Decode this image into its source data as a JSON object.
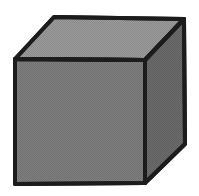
{
  "figure": {
    "colors": {
      "background": "#ffffff",
      "top_face": "#9c9c9c",
      "front_face": "#808080",
      "side_face": "#6c6c6c",
      "outline": "#1c1c1c"
    },
    "vertices": {
      "front_top_left": [
        15,
        59
      ],
      "front_top_right": [
        145,
        60
      ],
      "front_bottom_right": [
        145,
        183
      ],
      "front_bottom_left": [
        15,
        184
      ],
      "back_top_left": [
        54,
        17
      ],
      "back_top_right": [
        184,
        19
      ],
      "back_bottom_right": [
        185,
        144
      ]
    }
  }
}
